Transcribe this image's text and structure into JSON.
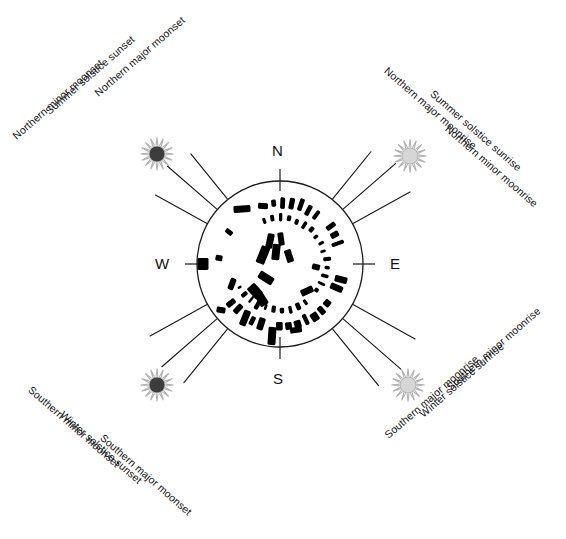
{
  "diagram": {
    "center": {
      "x": 280,
      "y": 264
    },
    "horizon_radius": 83,
    "colors": {
      "outline": "#1a1a1a",
      "stone_fill": "#000000",
      "moon_gray": "#8c8c8c",
      "sun_set_disc": "#3d3d3d",
      "sun_rise_disc": "#d6d6d6",
      "sun_rays": "#b0b0b0",
      "background": "#ffffff"
    }
  },
  "cardinals": [
    {
      "key": "north",
      "label": "N",
      "x": 272,
      "y": 142
    },
    {
      "key": "east",
      "label": "E",
      "x": 390,
      "y": 255
    },
    {
      "key": "south",
      "label": "S",
      "x": 273,
      "y": 370
    },
    {
      "key": "west",
      "label": "W",
      "x": 155,
      "y": 255
    }
  ],
  "alignments": [
    {
      "id": "northern-major-moonset",
      "label": "Northern major moonset",
      "icon": "moon-icon",
      "quadrant": "northwest",
      "ray_angle_deg": 231,
      "icon_x": 188,
      "icon_y": 136,
      "label_x": 96,
      "label_y": 88,
      "label_rotate_deg": -41
    },
    {
      "id": "summer-solstice-sunset",
      "label": "Summer solstice sunset",
      "icon": "sun-set-icon",
      "quadrant": "northwest",
      "ray_angle_deg": 221,
      "icon_x": 157,
      "icon_y": 154,
      "label_x": 47,
      "label_y": 106,
      "label_rotate_deg": -41
    },
    {
      "id": "northern-minor-moonset",
      "label": "Northern minor moonset",
      "icon": "moon-icon",
      "quadrant": "northwest",
      "ray_angle_deg": 209,
      "icon_x": 140,
      "icon_y": 190,
      "label_x": 14,
      "label_y": 131,
      "label_rotate_deg": -41
    },
    {
      "id": "northern-major-moonrise",
      "label": "Northern major moonrise",
      "icon": "moon-icon",
      "quadrant": "northeast",
      "ray_angle_deg": 309,
      "icon_x": 374,
      "icon_y": 134,
      "label_x": 386,
      "label_y": 63,
      "label_rotate_deg": 41
    },
    {
      "id": "summer-solstice-sunrise",
      "label": "Summer solstice sunrise",
      "icon": "sun-rise-icon",
      "quadrant": "northeast",
      "ray_angle_deg": 319,
      "icon_x": 410,
      "icon_y": 156,
      "label_x": 432,
      "label_y": 86,
      "label_rotate_deg": 41
    },
    {
      "id": "northern-minor-moonrise",
      "label": "Northern minor moonrise",
      "icon": "moon-icon",
      "quadrant": "northeast",
      "ray_angle_deg": 331,
      "icon_x": 427,
      "icon_y": 190,
      "label_x": 447,
      "label_y": 121,
      "label_rotate_deg": 41
    },
    {
      "id": "southern-minor-moonset",
      "label": "Southern minor moonset",
      "icon": "moon-icon",
      "quadrant": "southwest",
      "ray_angle_deg": 151,
      "icon_x": 141,
      "icon_y": 352,
      "label_x": 30,
      "label_y": 382,
      "label_rotate_deg": 41
    },
    {
      "id": "winter-solstice-sunset",
      "label": "Winter solstice sunset",
      "icon": "sun-set-icon",
      "quadrant": "southwest",
      "ray_angle_deg": 139,
      "icon_x": 157,
      "icon_y": 385,
      "label_x": 62,
      "label_y": 407,
      "label_rotate_deg": 41
    },
    {
      "id": "southern-major-moonset",
      "label": "Southern major moonset",
      "icon": "moon-icon",
      "quadrant": "southwest",
      "ray_angle_deg": 129,
      "icon_x": 186,
      "icon_y": 404,
      "label_x": 102,
      "label_y": 430,
      "label_rotate_deg": 41
    },
    {
      "id": "southern-minor-moonrise",
      "label": "Southern minor moonrise",
      "icon": "moon-icon",
      "quadrant": "southeast",
      "ray_angle_deg": 29,
      "icon_x": 426,
      "icon_y": 352,
      "label_x": 448,
      "label_y": 382,
      "label_rotate_deg": -41
    },
    {
      "id": "winter-solstice-sunrise",
      "label": "Winter solstice sunrise",
      "icon": "sun-rise-icon",
      "quadrant": "southeast",
      "ray_angle_deg": 41,
      "icon_x": 408,
      "icon_y": 385,
      "label_x": 421,
      "label_y": 409,
      "label_rotate_deg": -41
    },
    {
      "id": "southern-major-moonrise",
      "label": "Southern major moonrise",
      "icon": "moon-icon",
      "quadrant": "southeast",
      "ray_angle_deg": 51,
      "icon_x": 381,
      "icon_y": 404,
      "label_x": 386,
      "label_y": 430,
      "label_rotate_deg": -41
    }
  ],
  "stone_plan": {
    "description": "Plan of Stonehenge: outer sarsen circle, inner bluestone circle, trilithon horseshoe and fallen stones",
    "sarsen_ring": {
      "radius": 62,
      "count": 30,
      "start_deg": -96,
      "end_deg": 150
    },
    "bluestone_ring": {
      "radius": 46,
      "count": 26,
      "start_deg": -110,
      "end_deg": 150
    },
    "trilithons": [
      {
        "x": 270,
        "y": 241,
        "w": 7,
        "h": 15,
        "rot": 12
      },
      {
        "x": 281,
        "y": 239,
        "w": 6,
        "h": 13,
        "rot": -8
      },
      {
        "x": 263,
        "y": 255,
        "w": 9,
        "h": 18,
        "rot": 22
      },
      {
        "x": 276,
        "y": 252,
        "w": 8,
        "h": 16,
        "rot": 6
      },
      {
        "x": 289,
        "y": 256,
        "w": 7,
        "h": 13,
        "rot": -18
      },
      {
        "x": 266,
        "y": 278,
        "w": 16,
        "h": 8,
        "rot": 32
      },
      {
        "x": 255,
        "y": 291,
        "w": 14,
        "h": 10,
        "rot": 48
      },
      {
        "x": 262,
        "y": 300,
        "w": 12,
        "h": 9,
        "rot": 58
      }
    ],
    "fallen_stones": [
      {
        "x": 242,
        "y": 209,
        "w": 17,
        "h": 7,
        "rot": -4
      },
      {
        "x": 263,
        "y": 206,
        "w": 10,
        "h": 6,
        "rot": 3
      },
      {
        "x": 229,
        "y": 232,
        "w": 8,
        "h": 5,
        "rot": 38
      },
      {
        "x": 219,
        "y": 258,
        "w": 7,
        "h": 6,
        "rot": 10
      },
      {
        "x": 203,
        "y": 264,
        "w": 11,
        "h": 12,
        "rot": 0
      },
      {
        "x": 232,
        "y": 284,
        "w": 6,
        "h": 12,
        "rot": 20
      },
      {
        "x": 221,
        "y": 310,
        "w": 9,
        "h": 6,
        "rot": 8
      },
      {
        "x": 245,
        "y": 318,
        "w": 7,
        "h": 16,
        "rot": 22
      },
      {
        "x": 272,
        "y": 336,
        "w": 8,
        "h": 18,
        "rot": 4
      },
      {
        "x": 296,
        "y": 330,
        "w": 12,
        "h": 6,
        "rot": -8
      },
      {
        "x": 316,
        "y": 267,
        "w": 8,
        "h": 6,
        "rot": 14
      },
      {
        "x": 307,
        "y": 291,
        "w": 13,
        "h": 7,
        "rot": -24
      }
    ]
  }
}
